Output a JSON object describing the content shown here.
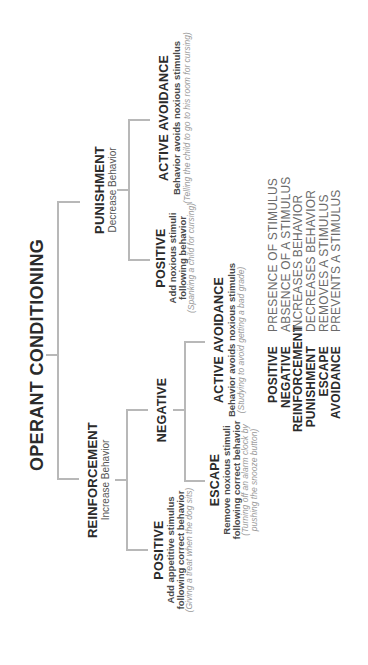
{
  "diagram": {
    "title": "OPERANT CONDITIONING",
    "line_color": "#b8b8b8",
    "text_color": "#2b2b2b",
    "example_color": "#9a9a9a",
    "punishment": {
      "title": "PUNISHMENT",
      "subtitle": "Decrease Behavior",
      "positive": {
        "title": "POSITIVE",
        "line1": "Add noxious stimuli",
        "line2": "following behavior",
        "example": "(Spanking a child for cursing)"
      },
      "active_avoidance": {
        "title": "ACTIVE AVOIDANCE",
        "subtitle": "Behavior avoids noxious stimulus",
        "example": "(Telling the child to go to his room for cursing)"
      }
    },
    "reinforcement": {
      "title": "REINFORCEMENT",
      "subtitle": "Increase Behavior",
      "positive": {
        "title": "POSITIVE",
        "line1": "Add appetitive stimulus",
        "line2": "following correct behavior",
        "example": "(Giving a treat when the dog sits)"
      },
      "negative": {
        "title": "NEGATIVE",
        "active_avoidance": {
          "title": "ACTIVE AVOIDANCE",
          "subtitle": "Behavior avoids noxious stimulus",
          "example": "(Studying to avoid getting a bad grade)"
        },
        "escape": {
          "title": "ESCAPE",
          "line1": "Remove noxious stimuli",
          "line2": "following correct behavior",
          "example1": "(Turning off an alarm clock by",
          "example2": "pushing the snooze button)"
        }
      }
    }
  },
  "legend": [
    {
      "term": "POSITIVE",
      "definition": "PRESENCE OF STIMULUS"
    },
    {
      "term": "NEGATIVE",
      "definition": "ABSENCE OF A STIMULUS"
    },
    {
      "term": "REINFORCEMENT",
      "definition": "INCREASES BEHAVIOR"
    },
    {
      "term": "PUNISHMENT",
      "definition": "DECREASES BEHAVIOR"
    },
    {
      "term": "ESCAPE",
      "definition": "REMOVES A STIMULUS"
    },
    {
      "term": "AVOIDANCE",
      "definition": "PREVENTS A STIMULUS"
    }
  ]
}
